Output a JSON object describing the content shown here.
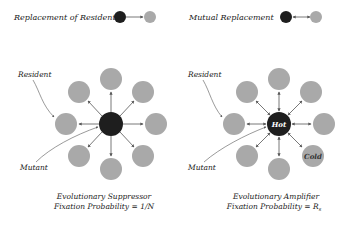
{
  "colors": {
    "mutant": "#1e1e1e",
    "resident": "#a9a9a9",
    "arrow": "#555555",
    "text": "#222222",
    "hot_text": "#ffffff",
    "cold_text": "#333333"
  },
  "legend": {
    "replacement_label": "Replacement of Resident",
    "mutual_label": "Mutual Replacement"
  },
  "left_diagram": {
    "resident_label": "Resident",
    "mutant_label": "Mutant",
    "caption_line1": "Evolutionary Suppressor",
    "caption_line2": "Fixation Probability = 1/N"
  },
  "right_diagram": {
    "resident_label": "Resident",
    "mutant_label": "Mutant",
    "hot_label": "Hot",
    "cold_label": "Cold",
    "caption_line1": "Evolutionary Amplifier",
    "caption_line2": "Fixation Probability = R",
    "caption_subscript": "s"
  }
}
